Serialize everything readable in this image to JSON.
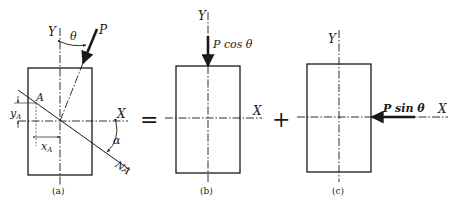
{
  "figure": {
    "operators": {
      "equals": "=",
      "plus": "+"
    },
    "panels": [
      {
        "id": "a",
        "caption": "(a)",
        "labels": {
          "y_axis": "Y",
          "x_axis": "X",
          "force": "P",
          "angle_theta": "θ",
          "point": "A",
          "y_offset": "y",
          "y_offset_sub": "A",
          "x_offset": "x",
          "x_offset_sub": "A",
          "angle_alpha": "α",
          "neutral_axis": "NA"
        }
      },
      {
        "id": "b",
        "caption": "(b)",
        "labels": {
          "y_axis": "Y",
          "x_axis": "X",
          "force": "P cos θ"
        }
      },
      {
        "id": "c",
        "caption": "(c)",
        "labels": {
          "y_axis": "Y",
          "x_axis": "X",
          "force": "P sin θ"
        }
      }
    ]
  }
}
